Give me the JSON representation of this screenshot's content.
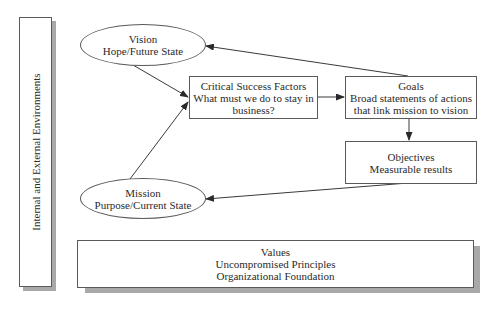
{
  "diagram": {
    "environment_panel": {
      "label": "Internal and External Environments"
    },
    "vision": {
      "title": "Vision",
      "subtitle": "Hope/Future State"
    },
    "mission": {
      "title": "Mission",
      "subtitle": "Purpose/Current State"
    },
    "critical_success_factors": {
      "title": "Critical Success Factors",
      "line1": "What must we do to stay in",
      "line2": "business?"
    },
    "goals": {
      "title": "Goals",
      "line1": "Broad statements of actions",
      "line2": "that link mission to vision"
    },
    "objectives": {
      "title": "Objectives",
      "subtitle": "Measurable results"
    },
    "values": {
      "title": "Values",
      "line1": "Uncompromised Principles",
      "line2": "Organizational Foundation"
    },
    "edges": [
      {
        "from": "vision",
        "to": "critical_success_factors"
      },
      {
        "from": "mission",
        "to": "critical_success_factors"
      },
      {
        "from": "critical_success_factors",
        "to": "goals"
      },
      {
        "from": "goals",
        "to": "vision"
      },
      {
        "from": "goals",
        "to": "objectives"
      },
      {
        "from": "objectives",
        "to": "mission"
      }
    ],
    "colors": {
      "stroke": "#3a3a3a",
      "shadow": "#a9a9a9",
      "background": "#ffffff"
    }
  }
}
